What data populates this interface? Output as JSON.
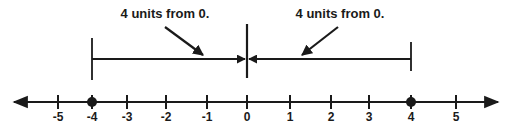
{
  "diagram": {
    "type": "number-line",
    "title": "",
    "axis": {
      "min": -5,
      "max": 5,
      "ticks": [
        -5,
        -4,
        -3,
        -2,
        -1,
        0,
        1,
        2,
        3,
        4,
        5
      ],
      "tick_labels": [
        "-5",
        "-4",
        "-3",
        "-2",
        "-1",
        "0",
        "1",
        "2",
        "3",
        "4",
        "5"
      ],
      "arrows_both_ends": true
    },
    "points": [
      {
        "value": -4,
        "label": "-4"
      },
      {
        "value": 4,
        "label": "4"
      }
    ],
    "distance_brackets": [
      {
        "from": -4,
        "to": 0,
        "label": "4 units from 0."
      },
      {
        "from": 4,
        "to": 0,
        "label": "4 units from 0."
      }
    ],
    "line_color": "#1a1a1a"
  }
}
